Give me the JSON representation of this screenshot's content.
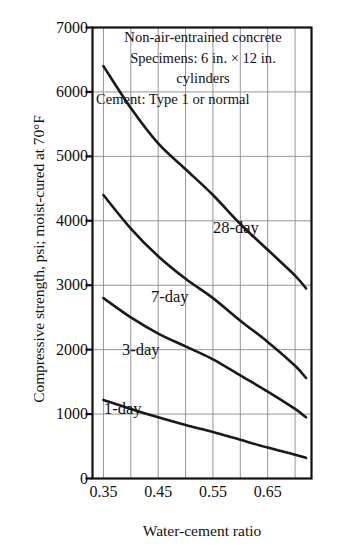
{
  "chart_data": {
    "type": "line",
    "title": "",
    "xlabel": "Water-cement ratio",
    "ylabel": "Compressive strength, psi; moist-cured at 70°F",
    "xlim": [
      0.33,
      0.73
    ],
    "ylim": [
      0,
      7000
    ],
    "xticks": [
      0.35,
      0.45,
      0.55,
      0.65
    ],
    "xtick_labels": [
      "0.35",
      "0.45",
      "0.55",
      "0.65"
    ],
    "xticks_minor": [
      0.4,
      0.5,
      0.6,
      0.7
    ],
    "yticks": [
      0,
      1000,
      2000,
      3000,
      4000,
      5000,
      6000,
      7000
    ],
    "ytick_labels": [
      "0",
      "1000",
      "2000",
      "3000",
      "4000",
      "5000",
      "6000",
      "7000"
    ],
    "grid": true,
    "grid_color": "#8a8a8a",
    "curve_color": "#1a1a1a",
    "legend_position": "inline-curve-labels",
    "annotations": [
      "Non-air-entrained concrete",
      "Specimens: 6 in. × 12 in.",
      "cylinders",
      "Cement: Type 1 or normal"
    ],
    "series": [
      {
        "name": "28-day",
        "label": "28-day",
        "x": [
          0.35,
          0.4,
          0.45,
          0.5,
          0.55,
          0.6,
          0.65,
          0.7,
          0.72
        ],
        "values": [
          6400,
          5750,
          5200,
          4800,
          4400,
          3950,
          3550,
          3150,
          2950
        ]
      },
      {
        "name": "7-day",
        "label": "7-day",
        "x": [
          0.35,
          0.4,
          0.45,
          0.5,
          0.55,
          0.6,
          0.65,
          0.7,
          0.72
        ],
        "values": [
          4400,
          3880,
          3450,
          3100,
          2800,
          2450,
          2120,
          1750,
          1560
        ]
      },
      {
        "name": "3-day",
        "label": "3-day",
        "x": [
          0.35,
          0.4,
          0.45,
          0.5,
          0.55,
          0.6,
          0.65,
          0.7,
          0.72
        ],
        "values": [
          2800,
          2500,
          2250,
          2050,
          1850,
          1600,
          1350,
          1080,
          950
        ]
      },
      {
        "name": "1-day",
        "label": "1-day",
        "x": [
          0.35,
          0.4,
          0.45,
          0.5,
          0.55,
          0.6,
          0.65,
          0.7,
          0.72
        ],
        "values": [
          1220,
          1080,
          950,
          830,
          720,
          600,
          480,
          370,
          320
        ]
      }
    ],
    "curve_label_positions": [
      {
        "name": "28-day",
        "left": 213,
        "top": 219
      },
      {
        "name": "7-day",
        "left": 151,
        "top": 288
      },
      {
        "name": "3-day",
        "left": 122,
        "top": 341
      },
      {
        "name": "1-day",
        "left": 104,
        "top": 400
      }
    ]
  }
}
